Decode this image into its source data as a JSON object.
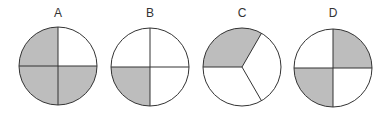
{
  "figure": {
    "fill_color": "#bdbdbd",
    "stroke_color": "#333333",
    "circles": [
      {
        "label": "A",
        "cx": 58,
        "cy": 66,
        "r": 39,
        "divisions": 4,
        "division_lines_deg": [
          0,
          90,
          180,
          270
        ],
        "shaded_sectors": [
          "upper-left",
          "lower-left",
          "lower-right"
        ],
        "shaded_fraction": "3/4"
      },
      {
        "label": "B",
        "cx": 150,
        "cy": 67,
        "r": 39,
        "divisions": 4,
        "division_lines_deg": [
          0,
          90,
          180,
          270
        ],
        "shaded_sectors": [
          "lower-left"
        ],
        "shaded_fraction": "1/4"
      },
      {
        "label": "C",
        "cx": 242,
        "cy": 67,
        "r": 39,
        "divisions": 3,
        "division_lines_deg": [
          180,
          60,
          300
        ],
        "shaded_sectors": [
          "upper-left (180° to 60°)"
        ],
        "shaded_fraction": "1/3"
      },
      {
        "label": "D",
        "cx": 333,
        "cy": 68,
        "r": 39,
        "divisions": 4,
        "division_lines_deg": [
          0,
          90,
          180,
          270
        ],
        "shaded_sectors": [
          "upper-right",
          "lower-left"
        ],
        "shaded_fraction": "2/4"
      }
    ]
  }
}
